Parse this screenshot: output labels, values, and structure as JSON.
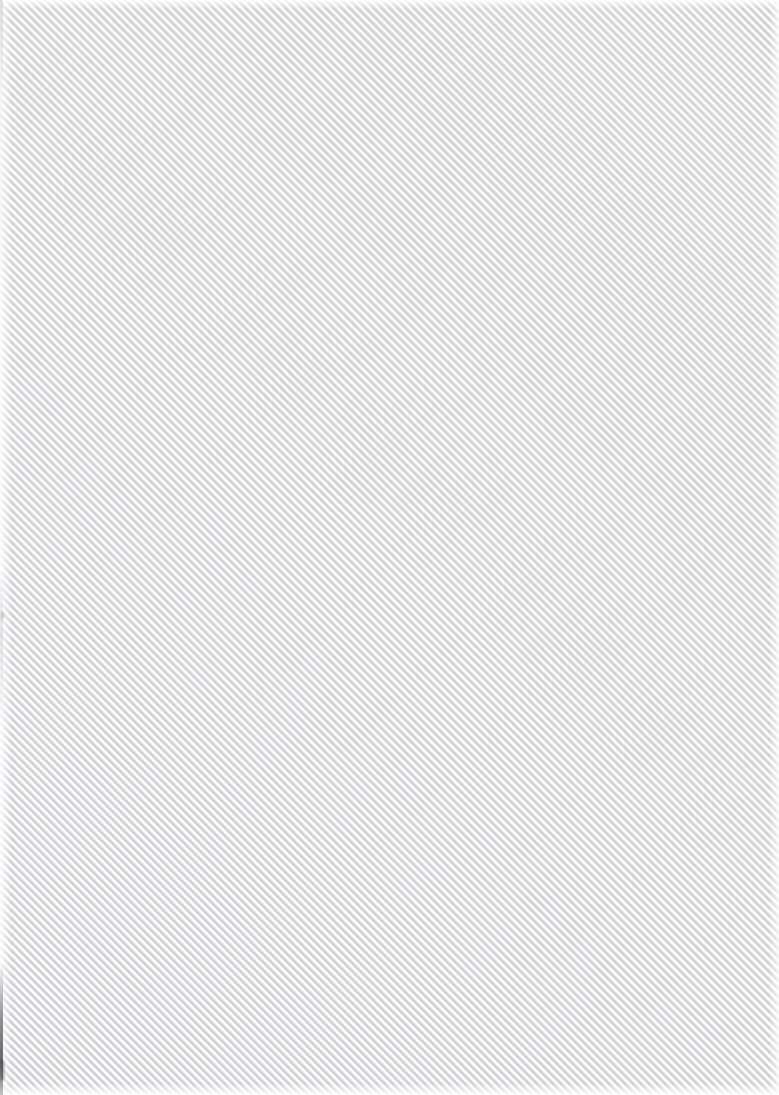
{
  "surface": {
    "name": "diagonal-stripe-texture",
    "description": "Full-bleed diagonal stripe texture surface with no interface controls, text, or icons present.",
    "width_px": 779,
    "height_px": 1095
  },
  "pattern": {
    "type": "diagonal-stripes",
    "angle_deg": 45,
    "direction": "bottom-left-to-top-right",
    "horizontal_period_px": 8,
    "perpendicular_period_px": 5.66,
    "duty_cycle_pct": 50,
    "stripe_color": "#c9c9cd",
    "stripe_highlight_color": "#d8d8dc",
    "base_color": "#fafafa",
    "paper_color": "#fdfdfd"
  },
  "edges": {
    "top_fade_px": 4,
    "bottom_fade_px": 8,
    "left_fade_px": 8,
    "right_fade_px": 6,
    "left_seam_color": "#3c3c42",
    "fade_color": "#ffffff"
  },
  "content": {
    "text_elements": 0,
    "icon_elements": 0,
    "control_elements": 0
  }
}
